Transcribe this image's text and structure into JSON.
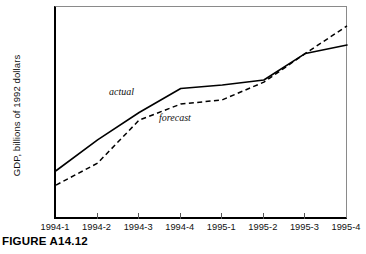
{
  "figure": {
    "caption": "FIGURE A14.12"
  },
  "chart_data": {
    "type": "line",
    "title": "",
    "xlabel": "",
    "ylabel": "GDP, billions of 1992 dollars",
    "categories": [
      "1994-1",
      "1994-2",
      "1994-3",
      "1994-4",
      "1995-1",
      "1995-2",
      "1995-3",
      "1995-4"
    ],
    "ylim": [
      6400,
      6900
    ],
    "yticks": [
      6400,
      6500,
      6600,
      6700,
      6800,
      6900
    ],
    "ytick_labels": [
      "6,400",
      "6,500",
      "6,600",
      "6,700",
      "6,800",
      "6,900"
    ],
    "grid": false,
    "legend": "inline-annotations",
    "series": [
      {
        "name": "actual",
        "style": "solid",
        "color": "#000000",
        "values": [
          6512,
          6585,
          6650,
          6707,
          6715,
          6727,
          6790,
          6810
        ]
      },
      {
        "name": "forecast",
        "style": "dashed",
        "color": "#000000",
        "values": [
          6478,
          6530,
          6632,
          6670,
          6680,
          6722,
          6790,
          6855
        ]
      }
    ],
    "annotations": [
      {
        "text": "actual",
        "series": "actual"
      },
      {
        "text": "forecast",
        "series": "forecast"
      }
    ]
  }
}
